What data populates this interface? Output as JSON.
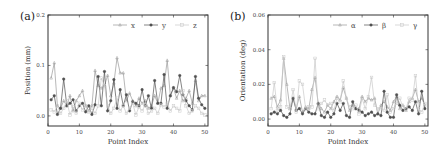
{
  "chart_data": [
    {
      "type": "line",
      "panel_label": "(a)",
      "title": "",
      "xlabel": "Point Index",
      "ylabel": "Position (mm)",
      "xlim": [
        0,
        51
      ],
      "ylim": [
        -0.02,
        0.2
      ],
      "xticks": [
        0,
        10,
        20,
        30,
        40,
        50
      ],
      "xtick_labels": [
        "0",
        "10",
        "20",
        "30",
        "40",
        "50"
      ],
      "yticks": [
        0.0,
        0.1,
        0.2
      ],
      "ytick_labels": [
        "0.0",
        "0.1",
        "0.2"
      ],
      "grid": false,
      "legend_position": "upper right",
      "x": [
        1,
        2,
        3,
        4,
        5,
        6,
        7,
        8,
        9,
        10,
        11,
        12,
        13,
        14,
        15,
        16,
        17,
        18,
        19,
        20,
        21,
        22,
        23,
        24,
        25,
        26,
        27,
        28,
        29,
        30,
        31,
        32,
        33,
        34,
        35,
        36,
        37,
        38,
        39,
        40,
        41,
        42,
        43,
        44,
        45,
        46,
        47,
        48,
        49,
        50
      ],
      "series": [
        {
          "name": "x",
          "color": "#9a9a9a",
          "marker": "triangle",
          "values": [
            0.075,
            0.105,
            0.02,
            0.015,
            0.03,
            0.02,
            0.04,
            0.01,
            0.03,
            0.04,
            0.05,
            0.02,
            0.01,
            0.02,
            0.09,
            0.06,
            0.055,
            0.06,
            0.08,
            0.04,
            0.065,
            0.115,
            0.085,
            0.085,
            0.03,
            0.045,
            0.03,
            0.02,
            0.035,
            0.025,
            0.03,
            0.015,
            0.02,
            0.04,
            0.025,
            0.055,
            0.06,
            0.11,
            0.04,
            0.055,
            0.035,
            0.05,
            0.03,
            0.035,
            0.05,
            0.025,
            0.07,
            0.03,
            0.04,
            0.04
          ]
        },
        {
          "name": "y",
          "color": "#505050",
          "marker": "circle",
          "values": [
            0.032,
            0.04,
            0.003,
            0.015,
            0.073,
            0.02,
            0.025,
            0.032,
            0.01,
            0.02,
            0.025,
            0.008,
            0.02,
            0.003,
            0.022,
            0.078,
            0.02,
            0.088,
            0.01,
            0.03,
            0.072,
            0.015,
            0.052,
            0.02,
            0.042,
            0.01,
            0.028,
            0.025,
            0.02,
            0.052,
            0.02,
            0.04,
            0.015,
            0.07,
            0.025,
            0.025,
            0.082,
            0.015,
            0.04,
            0.056,
            0.048,
            0.08,
            0.042,
            0.03,
            0.02,
            0.012,
            0.078,
            0.035,
            0.022,
            0.015
          ]
        },
        {
          "name": "z",
          "color": "#c8c8c8",
          "marker": "square",
          "values": [
            0.012,
            0.008,
            0.02,
            0.005,
            0.015,
            0.03,
            0.002,
            0.018,
            0.005,
            0.025,
            0.012,
            0.02,
            0.008,
            0.015,
            0.005,
            0.02,
            0.075,
            0.06,
            0.02,
            0.005,
            0.015,
            0.035,
            0.01,
            0.02,
            0.005,
            0.015,
            0.025,
            0.002,
            0.018,
            0.01,
            0.022,
            0.005,
            0.01,
            0.015,
            0.005,
            0.022,
            0.018,
            0.025,
            0.01,
            0.02,
            0.015,
            0.01,
            0.05,
            0.02,
            0.005,
            0.01,
            0.02,
            0.015,
            0.005,
            0.002
          ]
        }
      ]
    },
    {
      "type": "line",
      "panel_label": "(b)",
      "title": "",
      "xlabel": "Point Index",
      "ylabel": "Orientation (deg)",
      "xlim": [
        0,
        51
      ],
      "ylim": [
        -0.004,
        0.06
      ],
      "xticks": [
        0,
        10,
        20,
        30,
        40,
        50
      ],
      "xtick_labels": [
        "0",
        "10",
        "20",
        "30",
        "40",
        "50"
      ],
      "yticks": [
        0.0,
        0.02,
        0.04,
        0.06
      ],
      "ytick_labels": [
        "0.00",
        "0.02",
        "0.04",
        "0.06"
      ],
      "grid": false,
      "legend_position": "upper right",
      "x": [
        1,
        2,
        3,
        4,
        5,
        6,
        7,
        8,
        9,
        10,
        11,
        12,
        13,
        14,
        15,
        16,
        17,
        18,
        19,
        20,
        21,
        22,
        23,
        24,
        25,
        26,
        27,
        28,
        29,
        30,
        31,
        32,
        33,
        34,
        35,
        36,
        37,
        38,
        39,
        40,
        41,
        42,
        43,
        44,
        45,
        46,
        47,
        48,
        49,
        50
      ],
      "series": [
        {
          "name": "α",
          "color": "#9a9a9a",
          "marker": "triangle",
          "values": [
            0.012,
            0.013,
            0.007,
            0.011,
            0.035,
            0.02,
            0.006,
            0.012,
            0.006,
            0.013,
            0.004,
            0.007,
            0.006,
            0.017,
            0.024,
            0.009,
            0.006,
            0.004,
            0.008,
            0.006,
            0.01,
            0.013,
            0.011,
            0.018,
            0.012,
            0.005,
            0.008,
            0.006,
            0.006,
            0.013,
            0.01,
            0.012,
            0.011,
            0.012,
            0.003,
            0.008,
            0.01,
            0.007,
            0.005,
            0.01,
            0.013,
            0.006,
            0.008,
            0.005,
            0.01,
            0.012,
            0.017,
            0.01,
            0.012,
            0.008
          ]
        },
        {
          "name": "β",
          "color": "#505050",
          "marker": "circle",
          "values": [
            0.003,
            0.004,
            0.003,
            0.005,
            0.002,
            0.001,
            0.003,
            0.012,
            0.005,
            0.006,
            0.003,
            0.006,
            0.004,
            0.003,
            0.003,
            0.009,
            0.002,
            0.001,
            0.004,
            0.001,
            0.003,
            0.009,
            0.005,
            0.009,
            0.002,
            0.001,
            0.01,
            0.006,
            0.005,
            0.004,
            0.002,
            0.003,
            0.004,
            0.002,
            0.003,
            0.002,
            0.016,
            0.004,
            0.001,
            0.001,
            0.014,
            0.008,
            0.005,
            0.006,
            0.007,
            0.005,
            0.01,
            0.003,
            0.016,
            0.006
          ]
        },
        {
          "name": "γ",
          "color": "#c8c8c8",
          "marker": "square",
          "values": [
            0.006,
            0.021,
            0.005,
            0.007,
            0.036,
            0.007,
            0.006,
            0.017,
            0.004,
            0.022,
            0.02,
            0.006,
            0.007,
            0.007,
            0.035,
            0.006,
            0.009,
            0.011,
            0.008,
            0.009,
            0.005,
            0.012,
            0.01,
            0.022,
            0.012,
            0.007,
            0.006,
            0.008,
            0.003,
            0.012,
            0.006,
            0.013,
            0.024,
            0.008,
            0.006,
            0.006,
            0.005,
            0.014,
            0.004,
            0.006,
            0.009,
            0.012,
            0.007,
            0.006,
            0.012,
            0.011,
            0.025,
            0.006,
            0.004,
            0.009
          ]
        }
      ]
    }
  ]
}
